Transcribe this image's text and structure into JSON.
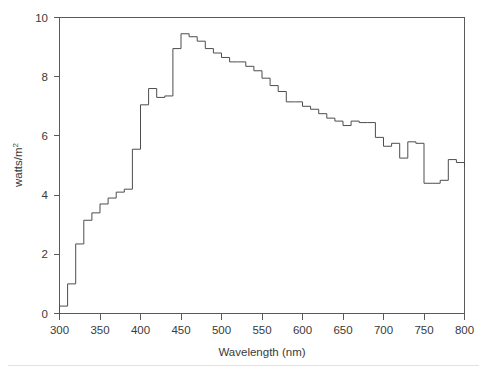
{
  "chart_data": {
    "type": "line",
    "style": "step-post",
    "title": "",
    "subtitle": "",
    "xlabel": "Wavelength (nm)",
    "ylabel": "watts/m",
    "ylabel_superscript": "2",
    "ylabel_full": "watts/m²",
    "xlim": [
      300,
      800
    ],
    "ylim": [
      0,
      10
    ],
    "xticks": [
      300,
      350,
      400,
      450,
      500,
      550,
      600,
      650,
      700,
      750,
      800
    ],
    "yticks": [
      0,
      2,
      4,
      6,
      8,
      10
    ],
    "xtick_labels": [
      "300",
      "350",
      "400",
      "450",
      "500",
      "550",
      "600",
      "650",
      "700",
      "750",
      "800"
    ],
    "ytick_labels": [
      "0",
      "2",
      "4",
      "6",
      "8",
      "10"
    ],
    "grid": false,
    "legend": false,
    "legend_position": "none",
    "line_color": "#4d4d4d",
    "axis_color": "#5a5a5a",
    "background_color": "#ffffff",
    "bin_width_nm": 10,
    "x": [
      300,
      310,
      320,
      330,
      340,
      350,
      360,
      370,
      380,
      390,
      400,
      410,
      420,
      430,
      440,
      450,
      460,
      470,
      480,
      490,
      500,
      510,
      520,
      530,
      540,
      550,
      560,
      570,
      580,
      590,
      600,
      610,
      620,
      630,
      640,
      650,
      660,
      670,
      680,
      690,
      700,
      710,
      720,
      730,
      740,
      750,
      760,
      770,
      780,
      790,
      800
    ],
    "values": [
      0.25,
      1.0,
      2.35,
      3.15,
      3.4,
      3.7,
      3.9,
      4.1,
      4.2,
      5.55,
      7.05,
      7.6,
      7.3,
      7.35,
      8.95,
      9.45,
      9.35,
      9.2,
      8.95,
      8.8,
      8.65,
      8.5,
      8.5,
      8.35,
      8.2,
      7.95,
      7.7,
      7.5,
      7.15,
      7.15,
      7.0,
      6.9,
      6.75,
      6.6,
      6.5,
      6.35,
      6.5,
      6.45,
      6.45,
      5.95,
      5.65,
      5.75,
      5.25,
      5.8,
      5.75,
      4.4,
      4.4,
      4.5,
      5.2,
      5.1,
      4.95
    ]
  },
  "axes": {
    "x_axis_name": "wavelength-axis",
    "y_axis_name": "irradiance-axis"
  }
}
